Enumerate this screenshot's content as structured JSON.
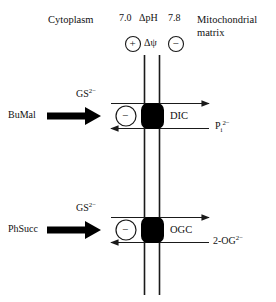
{
  "figure": {
    "background_color": "#ffffff",
    "line_color": "#1a1a1a",
    "block_color": "#000000"
  },
  "compartments": {
    "left_label": "Cytoplasm",
    "right_label_line1": "Mitochondrial",
    "right_label_line2": "matrix"
  },
  "gradients": {
    "ph_left_value": "7.0",
    "ph_symbol": "ΔpH",
    "ph_right_value": "7.8",
    "charge_left": "+",
    "membrane_potential_symbol": "Δψ",
    "charge_right": "−"
  },
  "carriers": [
    {
      "name": "DIC",
      "inhibitor": "BuMal",
      "influx_species": "GS",
      "influx_species_charge": "2−",
      "efflux_species": "P",
      "efflux_species_sub": "i",
      "efflux_species_charge": "2−",
      "inhibition_sign": "−"
    },
    {
      "name": "OGC",
      "inhibitor": "PhSucc",
      "influx_species": "GS",
      "influx_species_charge": "2−",
      "efflux_species": "2-OG",
      "efflux_species_sub": "",
      "efflux_species_charge": "2−",
      "inhibition_sign": "−"
    }
  ]
}
